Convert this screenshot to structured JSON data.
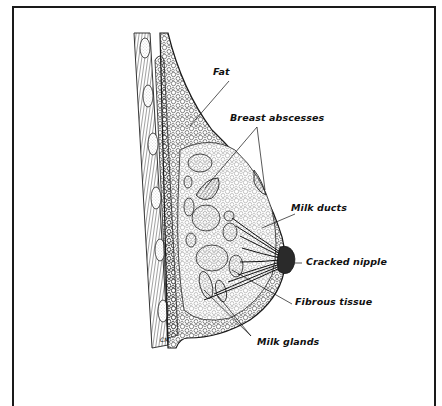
{
  "diagram": {
    "labels": [
      {
        "id": "fat",
        "text": "Fat"
      },
      {
        "id": "breast-abscesses",
        "text": "Breast abscesses"
      },
      {
        "id": "milk-ducts",
        "text": "Milk ducts"
      },
      {
        "id": "cracked-nipple",
        "text": "Cracked nipple"
      },
      {
        "id": "fibrous-tissue",
        "text": "Fibrous tissue"
      },
      {
        "id": "milk-glands",
        "text": "Milk glands"
      }
    ],
    "signature": "CM"
  },
  "colors": {
    "line": "#1a1a1a",
    "background": "#ffffff",
    "nipple": "#2a2a2a"
  }
}
